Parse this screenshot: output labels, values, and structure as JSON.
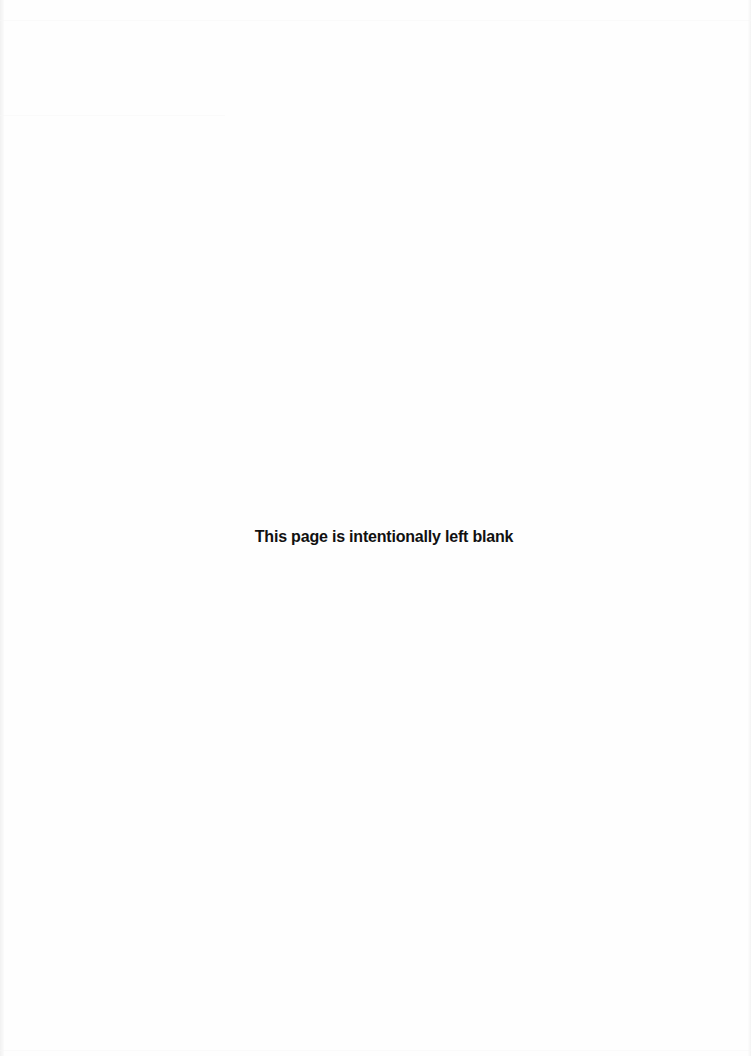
{
  "page": {
    "notice": "This page is intentionally left blank",
    "background_color": "#fefefe",
    "text_color": "#111111"
  }
}
